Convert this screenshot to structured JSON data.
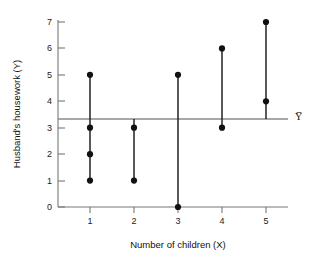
{
  "chart_data": {
    "type": "scatter",
    "title": "",
    "xlabel": "Number of children (X)",
    "ylabel": "Husband's housework (Y)",
    "xlim": [
      0.4,
      5.6
    ],
    "ylim": [
      0,
      7.4
    ],
    "xticks": [
      "1",
      "2",
      "3",
      "4",
      "5"
    ],
    "yticks": [
      "0",
      "1",
      "2",
      "3",
      "4",
      "5",
      "6",
      "7"
    ],
    "grid": false,
    "legend": "none",
    "mean_line": {
      "value": 3.33,
      "label": "Y̅",
      "color": "#8a8a8a"
    },
    "point_color": "#111111",
    "stem_color": "#222222",
    "groups": [
      {
        "x": 1,
        "values": [
          1,
          2,
          3,
          5
        ]
      },
      {
        "x": 2,
        "values": [
          1,
          3
        ]
      },
      {
        "x": 3,
        "values": [
          0,
          5
        ]
      },
      {
        "x": 4,
        "values": [
          3,
          6
        ]
      },
      {
        "x": 5,
        "values": [
          4,
          7
        ]
      }
    ],
    "points": [
      {
        "x": 1,
        "y": 5
      },
      {
        "x": 1,
        "y": 3
      },
      {
        "x": 1,
        "y": 2
      },
      {
        "x": 1,
        "y": 1
      },
      {
        "x": 2,
        "y": 3
      },
      {
        "x": 2,
        "y": 1
      },
      {
        "x": 3,
        "y": 5
      },
      {
        "x": 3,
        "y": 0
      },
      {
        "x": 4,
        "y": 6
      },
      {
        "x": 4,
        "y": 3
      },
      {
        "x": 5,
        "y": 7
      },
      {
        "x": 5,
        "y": 4
      }
    ]
  },
  "axis": {
    "x_title": "Number of children (X)",
    "y_title": "Husband's housework (Y)"
  },
  "yticks": {
    "t0": "0",
    "t1": "1",
    "t2": "2",
    "t3": "3",
    "t4": "4",
    "t5": "5",
    "t6": "6",
    "t7": "7"
  },
  "xticks": {
    "t1": "1",
    "t2": "2",
    "t3": "3",
    "t4": "4",
    "t5": "5"
  },
  "mean": {
    "label": "Y̅"
  }
}
